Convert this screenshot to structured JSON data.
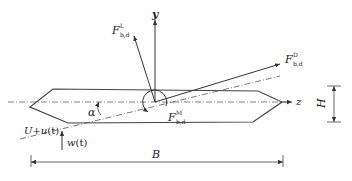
{
  "diagram": {
    "type": "bridge-deck-section-force-diagram",
    "axes": {
      "y_label": "y",
      "z_label": "z"
    },
    "forces": {
      "lift": {
        "base": "F",
        "sup": "L",
        "sub": "b,d"
      },
      "drag": {
        "base": "F",
        "sup": "D",
        "sub": "b,d"
      },
      "moment": {
        "base": "F",
        "sup": "M",
        "sub": "b,d"
      }
    },
    "angle_label": "α",
    "wind": {
      "horizontal_label": "U+u(t)",
      "horizontal_u": "U+",
      "horizontal_var": "u",
      "horizontal_t": "(t)",
      "vertical_var": "w",
      "vertical_t": "(t)"
    },
    "dimensions": {
      "width_label": "B",
      "height_label": "H"
    },
    "colors": {
      "stroke": "#333333",
      "axis": "#555555",
      "background": "#ffffff"
    }
  }
}
